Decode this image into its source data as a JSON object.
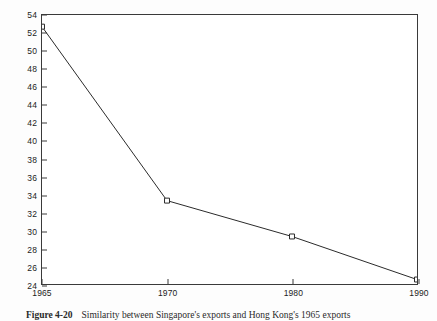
{
  "chart_data": {
    "type": "line",
    "title": "",
    "xlabel": "",
    "ylabel": "",
    "categories": [
      "1965",
      "1970",
      "1980",
      "1990"
    ],
    "x": [
      1965,
      1970,
      1980,
      1990
    ],
    "values": [
      52.7,
      33.3,
      29.3,
      24.5
    ],
    "series": [
      {
        "name": "Similarity index",
        "values": [
          52.7,
          33.3,
          29.3,
          24.5
        ]
      }
    ],
    "ylim": [
      24,
      54
    ],
    "ytick_step": 2,
    "yticks": [
      24,
      26,
      28,
      30,
      32,
      34,
      36,
      38,
      40,
      42,
      44,
      46,
      48,
      50,
      52,
      54
    ],
    "xticks": [
      "1965",
      "1970",
      "1980",
      "1990"
    ],
    "grid": false,
    "legend": false,
    "marker": "open-square",
    "line_color": "#2b2b2b",
    "marker_color": "#2b2b2b",
    "axis_color": "#3a3a3a",
    "plot_background": "#ffffff",
    "x_spacing": "categorical-even"
  },
  "caption": {
    "label": "Figure 4-20",
    "text": "Similarity between Singapore's exports and Hong Kong's 1965 exports"
  }
}
